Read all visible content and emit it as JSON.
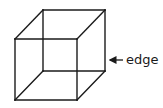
{
  "diagram": {
    "type": "wireframe-cube",
    "colors": {
      "stroke": "#1a1a1a",
      "background": "#ffffff"
    },
    "vertices": {
      "front_top_left": [
        15,
        39
      ],
      "front_top_right": [
        77,
        39
      ],
      "front_bottom_left": [
        15,
        100
      ],
      "front_bottom_right": [
        77,
        100
      ],
      "back_top_left": [
        43,
        10
      ],
      "back_top_right": [
        105,
        10
      ],
      "back_bottom_left": [
        43,
        71
      ],
      "back_bottom_right": [
        105,
        71
      ]
    },
    "label": {
      "text": "edge",
      "points_to": "back right vertical edge",
      "arrow": {
        "from": [
          123,
          60
        ],
        "to": [
          109,
          60
        ]
      }
    }
  }
}
